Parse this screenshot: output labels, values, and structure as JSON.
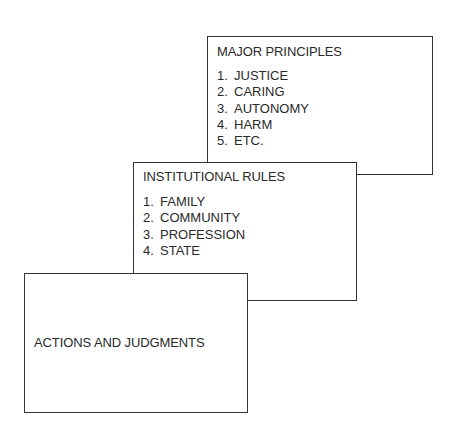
{
  "diagram": {
    "boxes": [
      {
        "id": "major-principles",
        "title": "MAJOR PRINCIPLES",
        "items": [
          {
            "num": "1.",
            "label": "JUSTICE"
          },
          {
            "num": "2.",
            "label": "CARING"
          },
          {
            "num": "3.",
            "label": "AUTONOMY"
          },
          {
            "num": "4.",
            "label": "HARM"
          },
          {
            "num": "5.",
            "label": "ETC."
          }
        ]
      },
      {
        "id": "institutional-rules",
        "title": "INSTITUTIONAL RULES",
        "items": [
          {
            "num": "1.",
            "label": "FAMILY"
          },
          {
            "num": "2.",
            "label": "COMMUNITY"
          },
          {
            "num": "3.",
            "label": "PROFESSION"
          },
          {
            "num": "4.",
            "label": "STATE"
          }
        ]
      },
      {
        "id": "actions-and-judgments",
        "title": "ACTIONS AND JUDGMENTS",
        "items": []
      }
    ]
  }
}
